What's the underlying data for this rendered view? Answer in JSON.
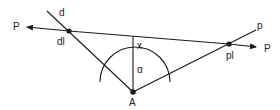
{
  "diagram": {
    "type": "geometry",
    "labels": {
      "P_left": "P",
      "P_right": "P",
      "d": "d",
      "dl": "dl",
      "p": "p",
      "pl": "pl",
      "x": "x",
      "alpha": "α",
      "A": "A"
    },
    "colors": {
      "line": "#1a1a1a",
      "background": "#ffffff"
    },
    "points": {
      "A": [
        133,
        92
      ],
      "dl": [
        69,
        31
      ],
      "pl": [
        229,
        44
      ],
      "line_P_start": [
        25,
        27
      ],
      "line_P_end": [
        258,
        48
      ],
      "d_end": [
        47,
        10
      ],
      "p_end": [
        256,
        30
      ],
      "x_foot": [
        133,
        37
      ]
    },
    "arc": {
      "center": [
        133,
        92
      ],
      "radius": 35
    }
  }
}
